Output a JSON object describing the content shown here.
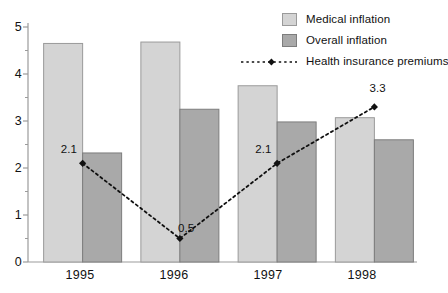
{
  "chart_data": {
    "type": "bar",
    "title": "",
    "xlabel": "",
    "ylabel": "",
    "categories": [
      "1995",
      "1996",
      "1997",
      "1998"
    ],
    "ylim": [
      0,
      5
    ],
    "yticks": [
      0,
      1,
      2,
      3,
      4,
      5
    ],
    "ytick_labels": [
      "0",
      "1",
      "2",
      "3",
      "4",
      "5"
    ],
    "minor_ticks": true,
    "grid": false,
    "legend_position": "top-right",
    "series": [
      {
        "name": "Medical inflation",
        "type": "bar",
        "color": "#d4d4d4",
        "values": [
          4.65,
          4.68,
          3.75,
          3.07
        ]
      },
      {
        "name": "Overall inflation",
        "type": "bar",
        "color": "#a9a9a9",
        "values": [
          2.32,
          3.25,
          2.98,
          2.6
        ]
      },
      {
        "name": "Health insurance premiums",
        "type": "line",
        "color": "#111111",
        "linestyle": "dotted",
        "marker": "diamond",
        "values": [
          2.1,
          0.5,
          2.1,
          3.3
        ],
        "data_labels": [
          "2.1",
          "0.5",
          "2.1",
          "3.3"
        ]
      }
    ]
  },
  "legend": {
    "items": [
      {
        "label": "Medical inflation",
        "marker": "swatch-light"
      },
      {
        "label": "Overall inflation",
        "marker": "swatch-dark"
      },
      {
        "label": "Health insurance premiums",
        "marker": "dotted-line-diamond"
      }
    ]
  },
  "axis": {
    "y_labels": [
      "5",
      "4",
      "3",
      "2",
      "1",
      "0"
    ],
    "x_labels": [
      "1995",
      "1996",
      "1997",
      "1998"
    ]
  },
  "colors": {
    "medical": "#d4d4d4",
    "overall": "#a9a9a9",
    "line": "#111111",
    "axis": "#9b9b9b",
    "text": "#111111",
    "background": "#ffffff"
  }
}
